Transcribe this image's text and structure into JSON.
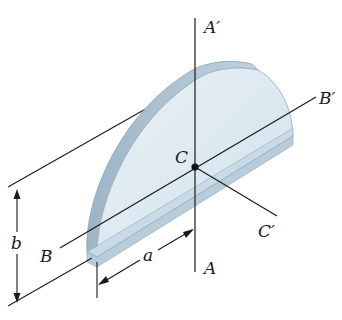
{
  "diagram": {
    "type": "3d-solid-axes",
    "shape": "half-disk (semicircular plate) with thickness",
    "colors": {
      "face": "#dde9f1",
      "face_light": "#e7f0f6",
      "edge_side": "#a9bfcf",
      "edge_dark": "#8fa7b8",
      "outline": "#7f96a6",
      "line": "#1a1a1a"
    },
    "labels": {
      "A_prime": "A′",
      "A": "A",
      "B_prime": "B′",
      "B": "B",
      "C": "C",
      "C_prime": "C′",
      "dim_a": "a",
      "dim_b": "b"
    },
    "axes": [
      {
        "name": "A–A′",
        "direction": "vertical through C"
      },
      {
        "name": "B–B′",
        "direction": "along the diameter through C"
      },
      {
        "name": "C–C′",
        "direction": "perpendicular to plate through C"
      }
    ],
    "dimensions": [
      {
        "symbol": "a",
        "meaning": "distance from plate edge to centroid axis A"
      },
      {
        "symbol": "b",
        "meaning": "height/thickness extent"
      }
    ]
  }
}
